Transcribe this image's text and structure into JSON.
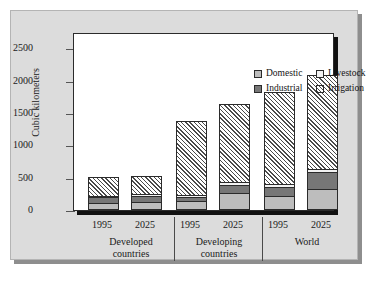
{
  "chart_data": {
    "type": "bar",
    "subtype": "stacked",
    "title": "",
    "xlabel": "",
    "ylabel": "Cubic kilometers",
    "ylim": [
      0,
      2750
    ],
    "yticks": [
      0,
      500,
      1000,
      1500,
      2000,
      2500
    ],
    "ytick_labels": [
      "0",
      "500",
      "1000",
      "1500",
      "2000",
      "2500"
    ],
    "grid": false,
    "legend_position": "top-right-inside",
    "categories": [
      "1995",
      "2025",
      "1995",
      "2025",
      "1995",
      "2025"
    ],
    "groups": [
      {
        "label_line1": "Developed",
        "label_line2": "countries",
        "members": [
          "1995",
          "2025"
        ]
      },
      {
        "label_line1": "Developing",
        "label_line2": "countries",
        "members": [
          "1995",
          "2025"
        ]
      },
      {
        "label_line1": "World",
        "label_line2": "",
        "members": [
          "1995",
          "2025"
        ]
      }
    ],
    "series": [
      {
        "name": "Domestic",
        "color": "#bdbdbd",
        "pattern": "solid",
        "values": [
          80,
          90,
          110,
          230,
          180,
          300
        ]
      },
      {
        "name": "Industrial",
        "color": "#777777",
        "pattern": "solid",
        "values": [
          90,
          100,
          60,
          130,
          150,
          250
        ]
      },
      {
        "name": "Livestock",
        "color": "#f2f2f2",
        "pattern": "solid",
        "values": [
          20,
          20,
          30,
          40,
          40,
          50
        ]
      },
      {
        "name": "Irrigation",
        "color": "#ffffff",
        "pattern": "diagonal-hatch",
        "values": [
          290,
          290,
          1150,
          1200,
          1430,
          1460
        ]
      }
    ],
    "totals": [
      480,
      500,
      1350,
      1600,
      1800,
      2060
    ]
  },
  "legend": {
    "items": [
      {
        "label": "Domestic",
        "swatch": "domestic-swatch"
      },
      {
        "label": "Livestock",
        "swatch": "livestock-swatch"
      },
      {
        "label": "Industrial",
        "swatch": "industrial-swatch"
      },
      {
        "label": "Irrigation",
        "swatch": "irrigation-swatch"
      }
    ]
  },
  "axis": {
    "y_title": "Cubic kilometers"
  }
}
